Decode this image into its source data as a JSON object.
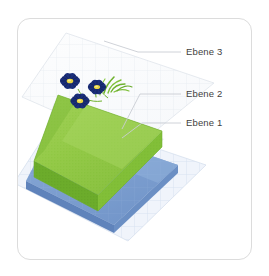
{
  "card": {
    "background": "#ffffff",
    "border_color": "#dcdcdc"
  },
  "illustration": {
    "title": "Drei gestapelte Ebenen mit Rasenflaeche und Blumen",
    "layers": [
      {
        "id": "ebene-3",
        "label": "Ebene 3",
        "description": "Oberste transparente Rasterflaeche mit Blumen",
        "color": "#f2f4f7",
        "grid_color": "#e3e7ee"
      },
      {
        "id": "ebene-2",
        "label": "Ebene 2",
        "description": "Gruene Rasenschicht",
        "color": "#8cc63f",
        "top_color": "#9ece54",
        "side_color": "#6aab2d",
        "shadow_color": "#5b9626"
      },
      {
        "id": "ebene-1",
        "label": "Ebene 1",
        "description": "Blaue Grundschicht",
        "color": "#7d9fd0",
        "top_color": "#93b2dc",
        "side_color": "#5f83bb",
        "grid_color": "#c6d6ea"
      }
    ],
    "flowers": {
      "count": 3,
      "petal_color": "#1b2f7a",
      "center_color": "#e8d441",
      "stem_color": "#6fb22e"
    },
    "leader_line_color": "#c9cdd4"
  },
  "labels": {
    "ebene3": "Ebene 3",
    "ebene2": "Ebene 2",
    "ebene1": "Ebene 1"
  }
}
